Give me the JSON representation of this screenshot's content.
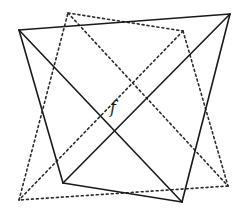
{
  "diagram": {
    "center_label": "f",
    "shapes": [
      {
        "name": "solid-quadrilateral",
        "style": "solid",
        "color": "#1a1a1a",
        "vertices": [
          "top-left",
          "top-right",
          "bottom-right",
          "bottom-left"
        ],
        "includes_diagonals": true
      },
      {
        "name": "dotted-quadrilateral",
        "style": "dotted",
        "color": "#2a2a2a",
        "vertices": [
          "top-left",
          "top-right",
          "bottom-right",
          "bottom-left"
        ],
        "includes_diagonals": true
      }
    ]
  }
}
